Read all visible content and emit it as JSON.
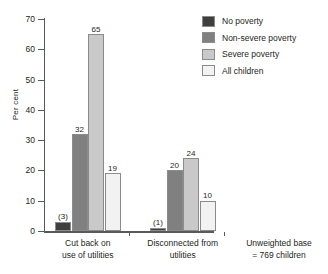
{
  "chart_data": {
    "type": "bar",
    "title": "",
    "xlabel": "",
    "ylabel": "Per cent",
    "ylim": [
      0,
      70
    ],
    "yticks": [
      0,
      10,
      20,
      30,
      40,
      50,
      60,
      70
    ],
    "grid": false,
    "legend_position": "top-right",
    "categories": [
      "Cut back on use of utilities",
      "Disconnected from utilities"
    ],
    "category_lines": [
      [
        "Cut back on",
        "use of utilities"
      ],
      [
        "Disconnected from",
        "utilities"
      ]
    ],
    "series": [
      {
        "name": "No poverty",
        "color": "#3f3f3f",
        "values": [
          3,
          1
        ],
        "labels": [
          "(3)",
          "(1)"
        ]
      },
      {
        "name": "Non-severe poverty",
        "color": "#808080",
        "values": [
          32,
          20
        ],
        "labels": [
          "32",
          "20"
        ]
      },
      {
        "name": "Severe poverty",
        "color": "#c9c9c9",
        "values": [
          65,
          24
        ],
        "labels": [
          "65",
          "24"
        ]
      },
      {
        "name": "All children",
        "color": "#f2f2f2",
        "values": [
          19,
          10
        ],
        "labels": [
          "19",
          "10"
        ]
      }
    ],
    "annotations": [
      "Unweighted base",
      "= 769 children"
    ]
  },
  "footnote": {
    "line1": "Unweighted base",
    "line2": "= 769 children"
  }
}
